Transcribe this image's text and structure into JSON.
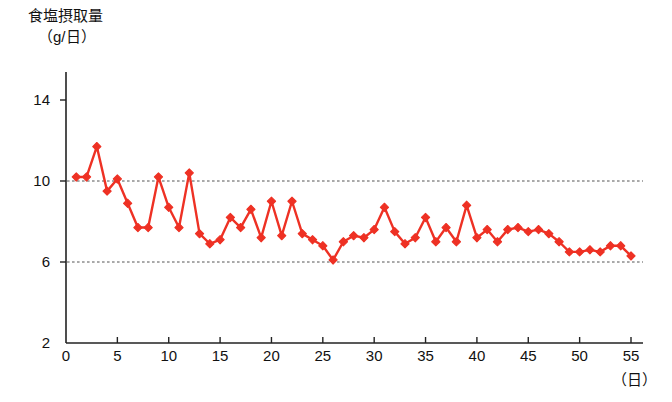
{
  "chart_data": {
    "type": "line",
    "title": "食塩摂取量",
    "subtitle": "（g/日）",
    "ylabel": "食塩摂取量（g/日）",
    "xlabel": "（日）",
    "xlabel_unit": "（日）",
    "series_name": "食塩摂取量",
    "series_color": "#EE3124",
    "marker": "diamond",
    "grid": "horizontal dotted gridlines at y = 6 and y = 10",
    "legend": "none",
    "xlim": [
      0,
      56
    ],
    "ylim": [
      2,
      15
    ],
    "yticks": [
      2,
      6,
      10,
      14
    ],
    "ytick_labels": [
      "2",
      "6",
      "10",
      "14"
    ],
    "xticks": [
      0,
      5,
      10,
      15,
      20,
      25,
      30,
      35,
      40,
      45,
      50,
      55
    ],
    "xtick_labels": [
      "0",
      "5",
      "10",
      "15",
      "20",
      "25",
      "30",
      "35",
      "40",
      "45",
      "50",
      "55"
    ],
    "gridlines": [
      6,
      10
    ],
    "x": [
      1,
      2,
      3,
      4,
      5,
      6,
      7,
      8,
      9,
      10,
      11,
      12,
      13,
      14,
      15,
      16,
      17,
      18,
      19,
      20,
      21,
      22,
      23,
      24,
      25,
      26,
      27,
      28,
      29,
      30,
      31,
      32,
      33,
      34,
      35,
      36,
      37,
      38,
      39,
      40,
      41,
      42,
      43,
      44,
      45,
      46,
      47,
      48,
      49,
      50,
      51,
      52,
      53,
      54,
      55
    ],
    "values": [
      10.2,
      10.2,
      11.7,
      9.5,
      10.1,
      8.9,
      7.7,
      7.7,
      10.2,
      8.7,
      7.7,
      10.4,
      7.4,
      6.9,
      7.1,
      8.2,
      7.7,
      8.6,
      7.2,
      9.0,
      7.3,
      9.0,
      7.4,
      7.1,
      6.8,
      6.1,
      7.0,
      7.3,
      7.2,
      7.6,
      8.7,
      7.5,
      6.9,
      7.2,
      8.2,
      7.0,
      7.7,
      7.0,
      8.8,
      7.2,
      7.6,
      7.0,
      7.6,
      7.7,
      7.5,
      7.6,
      7.4,
      7.0,
      6.5,
      6.5,
      6.6,
      6.5,
      6.8,
      6.8,
      6.3
    ],
    "series": [
      {
        "name": "食塩摂取量",
        "color": "#EE3124",
        "values": [
          10.2,
          10.2,
          11.7,
          9.5,
          10.1,
          8.9,
          7.7,
          7.7,
          10.2,
          8.7,
          7.7,
          10.4,
          7.4,
          6.9,
          7.1,
          8.2,
          7.7,
          8.6,
          7.2,
          9.0,
          7.3,
          9.0,
          7.4,
          7.1,
          6.8,
          6.1,
          7.0,
          7.3,
          7.2,
          7.6,
          8.7,
          7.5,
          6.9,
          7.2,
          8.2,
          7.0,
          7.7,
          7.0,
          8.8,
          7.2,
          7.6,
          7.0,
          7.6,
          7.7,
          7.5,
          7.6,
          7.4,
          7.0,
          6.5,
          6.5,
          6.6,
          6.5,
          6.8,
          6.8,
          6.3
        ]
      }
    ]
  },
  "axis": {
    "y_title_line1": "食塩摂取量",
    "y_title_line2": "（g/日）",
    "x_unit": "（日）"
  }
}
